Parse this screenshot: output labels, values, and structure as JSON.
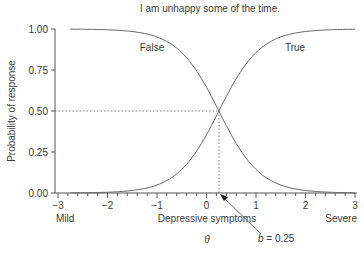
{
  "chart_data": {
    "type": "line",
    "title": "I am unhappy some of the time.",
    "xlabel": "Depressive symptoms",
    "xlabel_symbol": "θ",
    "ylabel": "Probability of response",
    "xlim": [
      -3,
      3
    ],
    "ylim": [
      0,
      1
    ],
    "x_ticks": [
      "−3",
      "−2",
      "−1",
      "0",
      "1",
      "2",
      "3"
    ],
    "y_ticks": [
      "0.00",
      "0.25",
      "0.50",
      "0.75",
      "1.00"
    ],
    "x_end_labels": {
      "left": "Mild",
      "right": "Severe"
    },
    "grid": false,
    "legend": "none",
    "series": [
      {
        "name": "False",
        "description": "1 − logistic(θ − 0.25), decreasing",
        "x": [
          -2.2,
          -1.5,
          -1,
          -0.5,
          0,
          0.25,
          0.5,
          1,
          1.5,
          2,
          2.7
        ],
        "values": [
          0.99,
          0.97,
          0.94,
          0.82,
          0.58,
          0.5,
          0.42,
          0.18,
          0.06,
          0.02,
          0.01
        ]
      },
      {
        "name": "True",
        "description": "logistic(θ − 0.25), increasing",
        "x": [
          -2.2,
          -1.5,
          -1,
          -0.5,
          0,
          0.25,
          0.5,
          1,
          1.5,
          2,
          2.7
        ],
        "values": [
          0.01,
          0.03,
          0.06,
          0.18,
          0.42,
          0.5,
          0.58,
          0.82,
          0.94,
          0.98,
          0.99
        ]
      }
    ],
    "annotations": [
      {
        "text": "False",
        "x": -1.0,
        "y": 0.9
      },
      {
        "text": "True",
        "x": 1.6,
        "y": 0.9
      },
      {
        "text": "b = 0.25",
        "points_to": [
          0.25,
          0.0
        ]
      },
      {
        "type": "dotted-hline",
        "y": 0.5,
        "from_x": -3,
        "to_x": 0.25
      },
      {
        "type": "dotted-vline",
        "x": 0.25,
        "from_y": 0,
        "to_y": 0.5
      }
    ],
    "difficulty_b": 0.25
  },
  "labels": {
    "b_italic": "b",
    "b_value": " = 0.25"
  }
}
